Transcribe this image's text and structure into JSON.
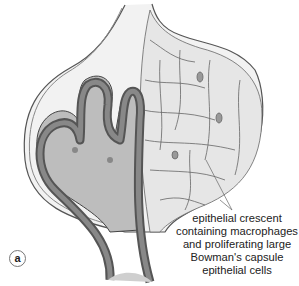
{
  "figure": {
    "panel_label": "a",
    "annotation": {
      "lines": [
        "epithelial crescent",
        "containing macrophages",
        "and proliferating large",
        "Bowman's capsule",
        "epithelial cells"
      ]
    }
  }
}
